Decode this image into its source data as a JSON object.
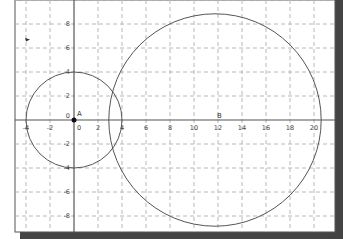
{
  "diagram": {
    "type": "coordinate-plane-circles",
    "x_axis": {
      "ticks": [
        -4,
        -2,
        0,
        2,
        4,
        6,
        8,
        10,
        12,
        14,
        16,
        18,
        20
      ],
      "range": [
        -5,
        21.7
      ]
    },
    "y_axis": {
      "ticks": [
        8,
        6,
        4,
        2,
        0,
        -2,
        -4,
        -6,
        -8
      ],
      "range": [
        -11.5,
        10
      ]
    },
    "grid": true,
    "points": [
      {
        "label": "A",
        "x": 0,
        "y": 0,
        "filled": true
      },
      {
        "label": "B",
        "x": 12,
        "y": 0,
        "filled": false
      }
    ],
    "circles": [
      {
        "name": "circle-a",
        "center": "A",
        "cx": 0,
        "cy": 0,
        "r": 4
      },
      {
        "name": "circle-b",
        "center": "B",
        "cx": 11.75,
        "cy": 0,
        "r": 8.85
      }
    ],
    "colors": {
      "axis": "#555555",
      "grid": "#b8b8b8",
      "curve": "#555555",
      "frame": "#555555",
      "shadow": "#3a3a3a"
    }
  },
  "labels": {
    "point_a": "A",
    "point_b": "B",
    "origin": "0",
    "x_ticks": [
      "-4",
      "-2",
      "0",
      "2",
      "4",
      "6",
      "8",
      "10",
      "12",
      "14",
      "16",
      "18",
      "20"
    ],
    "y_ticks": [
      "8",
      "6",
      "4",
      "2",
      "-2",
      "-4",
      "-6",
      "-8"
    ]
  }
}
